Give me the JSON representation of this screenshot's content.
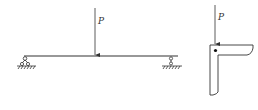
{
  "diagram": {
    "beam": {
      "load_label": "P",
      "left_support": "pin-roller",
      "right_support": "roller"
    },
    "section": {
      "load_label": "P",
      "shape": "angle (L-section)",
      "load_point": "dot at corner"
    },
    "colors": {
      "line": "#333333",
      "background": "#ffffff"
    }
  }
}
